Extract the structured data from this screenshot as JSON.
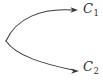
{
  "figure": {
    "type": "branching-curve-diagram",
    "background_color": "#ffffff",
    "stroke_color": "#3a3a3a",
    "text_color": "#2e2e2e",
    "width": 103,
    "height": 80,
    "origin": {
      "x": 6,
      "y": 41
    },
    "branches": [
      {
        "id": "c1",
        "label_base": "C",
        "label_subscript": "1",
        "direction": "upper-right",
        "path": "M 6 41 C 16 18, 42 8, 72 10",
        "arrow_tip": {
          "x": 78,
          "y": 10
        },
        "arrow_points": "78,10 70.5,7.2 72.4,10 70.5,12.8"
      },
      {
        "id": "c2",
        "label_base": "C",
        "label_subscript": "2",
        "direction": "lower-right",
        "path": "M 6 41 C 16 56, 44 64, 73 70",
        "arrow_tip": {
          "x": 79,
          "y": 71
        },
        "arrow_points": "79,71 71.2,68.6 73.2,71.2 71.1,73.8"
      }
    ]
  }
}
